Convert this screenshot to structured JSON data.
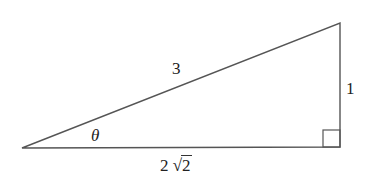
{
  "diagram": {
    "type": "right-triangle",
    "vertices": {
      "left": [
        22,
        148
      ],
      "top_right": [
        340,
        23
      ],
      "bottom_right": [
        340,
        147
      ]
    },
    "right_angle_marker": {
      "x": 323,
      "y": 130,
      "size": 17
    },
    "stroke_color": "#555555",
    "labels": {
      "hypotenuse": "3",
      "opposite": "1",
      "angle": "θ",
      "adjacent_coefficient": "2",
      "adjacent_radical_sign": "√",
      "adjacent_radicand": "2"
    }
  }
}
